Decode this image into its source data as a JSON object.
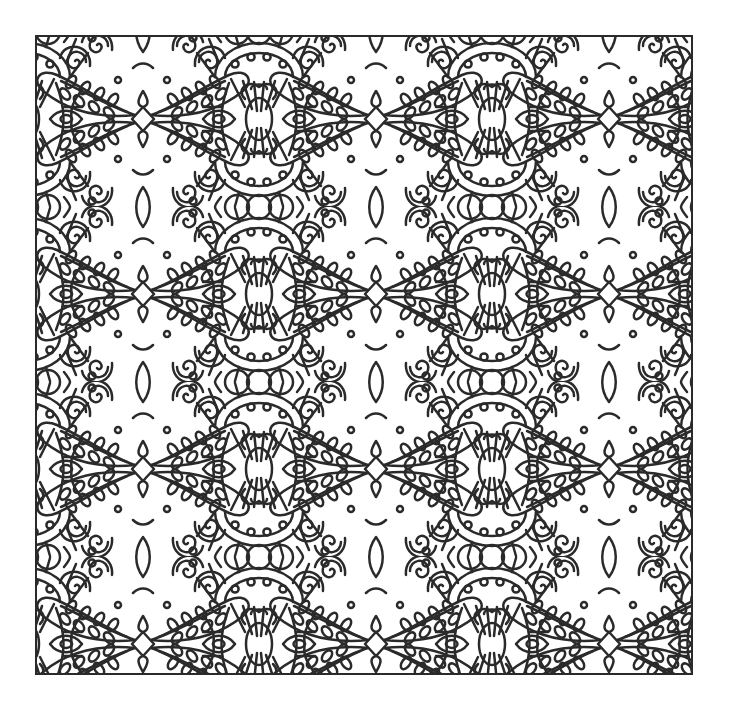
{
  "artwork": {
    "kind": "coloring-page",
    "subject": "ornamental seamless pattern",
    "description": "Black line-art ornamental pattern of repeating fan medallions, leaf-filled paisley lobes and scrolls inside a square frame",
    "motifs": [
      "fan-medallion",
      "central-lozenge",
      "leafy-paisley-lobe",
      "circle-trio",
      "spiral-scroll",
      "eye-ornament",
      "diamond-knot"
    ]
  },
  "style": {
    "background_color": "#ffffff",
    "line_color": "#2a2a2a",
    "line_width_px": 2.5
  },
  "layout": {
    "canvas_width": 730,
    "canvas_height": 709,
    "frame": {
      "x": 35,
      "y": 35,
      "width": 658,
      "height": 640
    },
    "tile": {
      "width": 233,
      "height": 175,
      "offset_x": -125,
      "offset_y": -3
    },
    "columns_visible": 3,
    "rows_visible": 4
  }
}
